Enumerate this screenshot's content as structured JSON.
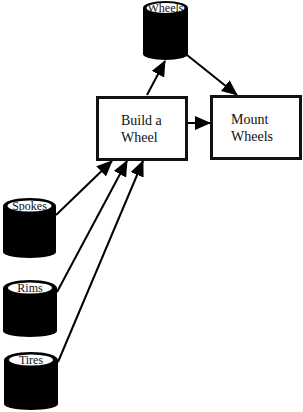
{
  "diagram": {
    "type": "data-flow",
    "processes": [
      {
        "id": "build",
        "label": "Build a\nWheel"
      },
      {
        "id": "mount",
        "label": "Mount\nWheels"
      }
    ],
    "stores": [
      {
        "id": "wheels",
        "label": "Wheels"
      },
      {
        "id": "spokes",
        "label": "Spokes"
      },
      {
        "id": "rims",
        "label": "Rims"
      },
      {
        "id": "tires",
        "label": "Tires"
      }
    ],
    "flows": [
      {
        "from": "spokes",
        "to": "build"
      },
      {
        "from": "rims",
        "to": "build"
      },
      {
        "from": "tires",
        "to": "build"
      },
      {
        "from": "build",
        "to": "wheels"
      },
      {
        "from": "wheels",
        "to": "mount"
      },
      {
        "from": "build",
        "to": "mount"
      }
    ],
    "colors": {
      "stroke": "#111111",
      "fill": "#000000",
      "background": "#ffffff"
    }
  }
}
